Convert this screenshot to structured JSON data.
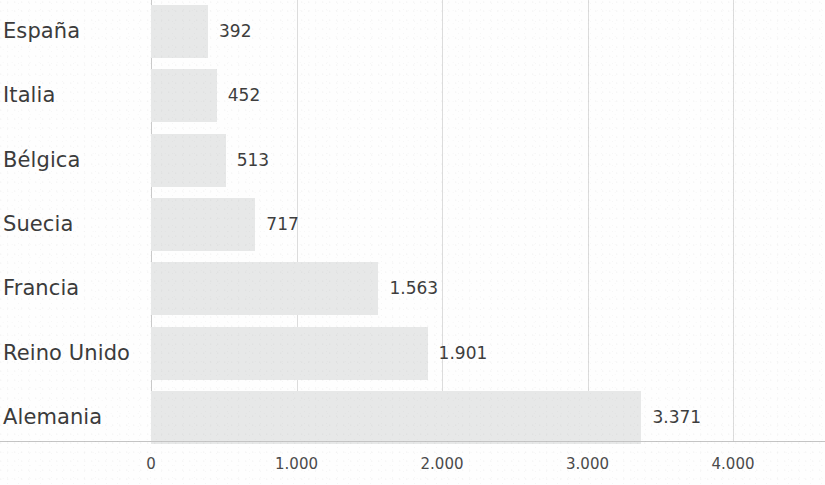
{
  "chart_data": {
    "type": "bar",
    "orientation": "horizontal",
    "title": "",
    "subtitle": "",
    "xlabel": "",
    "ylabel": "",
    "categories": [
      "España",
      "Italia",
      "Bélgica",
      "Suecia",
      "Francia",
      "Reino Unido",
      "Alemania"
    ],
    "values": [
      392,
      452,
      513,
      717,
      1563,
      1901,
      3371
    ],
    "value_labels": [
      "392",
      "452",
      "513",
      "717",
      "1.563",
      "1.901",
      "3.371"
    ],
    "xlim": [
      0,
      4400
    ],
    "xticks": [
      0,
      1000,
      2000,
      3000,
      4000
    ],
    "xtick_labels": [
      "0",
      "1.000",
      "2.000",
      "3.000",
      "4.000"
    ],
    "grid": true,
    "grid_axis": "x",
    "legend": false,
    "bar_color": "#e7e8e8",
    "gridline_color": "#dcdcdc",
    "axis_color": "#c4c4c4",
    "label_color": "#3b3b3b",
    "value_label_color": "#3d3d3d"
  }
}
